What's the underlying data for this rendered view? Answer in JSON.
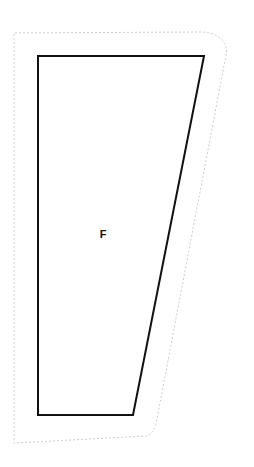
{
  "canvas": {
    "width": 254,
    "height": 467,
    "background_color": "#ffffff"
  },
  "diagram": {
    "title": "",
    "type": "outline-shape-diagram",
    "shapes": [
      {
        "name": "boundary-outline",
        "style": "dotted",
        "stroke_color": "#cccccc",
        "stroke_width": 1,
        "dash_pattern": "2 2",
        "fill": "none",
        "path": "M 14 36 L 14 33 L 200 32 Q 215 32 222 40 Q 228 47 226 55 L 156 424 Q 154 434 146 436 L 14 443 Z"
      },
      {
        "name": "main-polygon",
        "style": "solid",
        "stroke_color": "#111111",
        "stroke_width": 2,
        "fill": "#ffffff",
        "points": "38,56 204,56 133,415 38,415",
        "vertices": [
          {
            "x": 38,
            "y": 56
          },
          {
            "x": 204,
            "y": 56
          },
          {
            "x": 133,
            "y": 415
          },
          {
            "x": 38,
            "y": 415
          }
        ]
      }
    ],
    "labels": [
      {
        "name": "region-label-f",
        "text": "F",
        "x": 103,
        "y": 235,
        "font_size": 11,
        "font_weight": "bold",
        "color": "#111111"
      }
    ]
  }
}
